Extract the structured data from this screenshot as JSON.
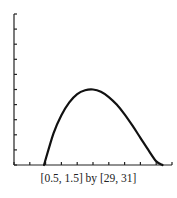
{
  "chart_data": {
    "type": "line",
    "title": "",
    "caption": "[0.5, 1.5] by [29, 31]",
    "xlabel": "",
    "ylabel": "",
    "xlim": [
      0.5,
      1.5
    ],
    "ylim": [
      29,
      31
    ],
    "x_tick_step": 0.1,
    "y_tick_step": 0.2,
    "grid": false,
    "legend": null,
    "series": [
      {
        "name": "curve",
        "x": [
          0.69,
          0.75,
          0.8,
          0.85,
          0.9,
          0.95,
          1.0,
          1.05,
          1.1,
          1.15,
          1.2,
          1.25,
          1.3,
          1.35,
          1.4,
          1.44
        ],
        "y": [
          29.0,
          29.42,
          29.66,
          29.83,
          29.94,
          29.99,
          30.0,
          29.97,
          29.9,
          29.8,
          29.67,
          29.52,
          29.36,
          29.2,
          29.05,
          29.0
        ]
      }
    ]
  }
}
